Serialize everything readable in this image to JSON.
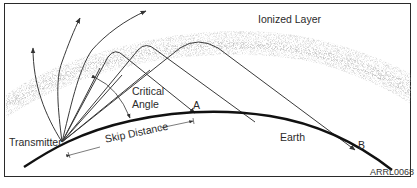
{
  "diagram": {
    "type": "sky-wave propagation",
    "labels": {
      "ionized_layer": "Ionized Layer",
      "critical": "Critical",
      "angle": "Angle",
      "transmitter": "Transmitter",
      "skip_distance": "Skip Distance",
      "earth": "Earth",
      "point_a": "A",
      "point_b": "B",
      "figure_code": "ARRL0068"
    },
    "colors": {
      "line": "#3a3a3a",
      "earth": "#111111",
      "ionosphere": "#9a9a9a",
      "frame": "#2a2a2a"
    },
    "rays": [
      {
        "kind": "escaping",
        "description": "passes through ionized layer"
      },
      {
        "kind": "escaping",
        "description": "passes through ionized layer"
      },
      {
        "kind": "escaping",
        "description": "passes through ionized layer"
      },
      {
        "kind": "reflected",
        "description": "returns at A (critical angle)"
      },
      {
        "kind": "reflected",
        "description": "returns beyond A"
      },
      {
        "kind": "reflected",
        "description": "returns at B"
      }
    ]
  }
}
